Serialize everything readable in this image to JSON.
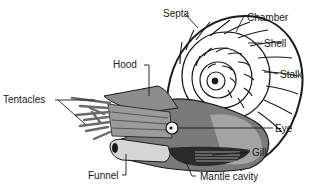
{
  "diagram": {
    "labels": {
      "septa": "Septa",
      "chamber": "Chamber",
      "shell": "Shell",
      "stalk": "Stalk",
      "hood": "Hood",
      "tentacles": "Tentacles",
      "eye": "Eye",
      "gill": "Gill",
      "funnel": "Funnel",
      "mantle_cavity": "Mantle cavity"
    },
    "colors": {
      "ink": "#1a1a1a",
      "body_gray": "#8a8a8a",
      "light_gray": "#c8c8c8",
      "dark_gray": "#4a4a4a",
      "background": "#ffffff"
    }
  }
}
